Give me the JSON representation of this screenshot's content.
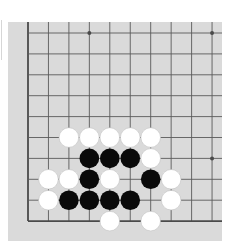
{
  "board": {
    "colors": {
      "board": "#dadada",
      "line": "#5a5a5a",
      "edge_line": "#4a4a4a",
      "black_stone": "#0a0a0a",
      "white_stone": "#ffffff",
      "white_outline": "#bdbdbd"
    },
    "grid": {
      "columns_visible": 10,
      "rows_visible": 10,
      "origin_x": 20,
      "origin_y": 11,
      "spacing_x": 20.45,
      "spacing_y": 20.9,
      "left_edge": true,
      "bottom_edge": true,
      "top_edge": false,
      "right_edge": false
    },
    "star_points": [
      {
        "col": 3,
        "row": 0
      },
      {
        "col": 9,
        "row": 0
      },
      {
        "col": 3,
        "row": 6
      },
      {
        "col": 9,
        "row": 6
      }
    ],
    "stones": [
      {
        "color": "white",
        "col": 2,
        "row": 5
      },
      {
        "color": "white",
        "col": 3,
        "row": 5
      },
      {
        "color": "white",
        "col": 4,
        "row": 5
      },
      {
        "color": "white",
        "col": 5,
        "row": 5
      },
      {
        "color": "white",
        "col": 6,
        "row": 5
      },
      {
        "color": "black",
        "col": 3,
        "row": 6
      },
      {
        "color": "black",
        "col": 4,
        "row": 6
      },
      {
        "color": "black",
        "col": 5,
        "row": 6
      },
      {
        "color": "white",
        "col": 6,
        "row": 6
      },
      {
        "color": "white",
        "col": 1,
        "row": 7
      },
      {
        "color": "white",
        "col": 2,
        "row": 7
      },
      {
        "color": "black",
        "col": 3,
        "row": 7
      },
      {
        "color": "white",
        "col": 4,
        "row": 7
      },
      {
        "color": "black",
        "col": 6,
        "row": 7
      },
      {
        "color": "white",
        "col": 7,
        "row": 7
      },
      {
        "color": "white",
        "col": 1,
        "row": 8
      },
      {
        "color": "black",
        "col": 2,
        "row": 8
      },
      {
        "color": "black",
        "col": 3,
        "row": 8
      },
      {
        "color": "black",
        "col": 4,
        "row": 8
      },
      {
        "color": "black",
        "col": 5,
        "row": 8
      },
      {
        "color": "white",
        "col": 7,
        "row": 8
      },
      {
        "color": "white",
        "col": 4,
        "row": 9
      },
      {
        "color": "white",
        "col": 6,
        "row": 9
      }
    ]
  }
}
